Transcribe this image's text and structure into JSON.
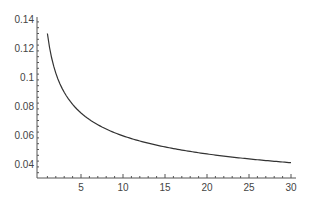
{
  "chart_data": {
    "type": "line",
    "title": "",
    "xlabel": "",
    "ylabel": "",
    "xlim": [
      0,
      31
    ],
    "ylim": [
      0.033,
      0.14
    ],
    "x_ticks": [
      5,
      10,
      15,
      20,
      25,
      30
    ],
    "y_ticks": [
      0.04,
      0.06,
      0.08,
      0.1,
      0.12,
      0.14
    ],
    "x_tick_labels": [
      "5",
      "10",
      "15",
      "20",
      "25",
      "30"
    ],
    "y_tick_labels": [
      "0.04",
      "0.06",
      "0.08",
      "0.1",
      "0.12",
      "0.14"
    ],
    "grid": false,
    "legend": null,
    "series": [
      {
        "name": "curve",
        "color": "#333333",
        "x": [
          1,
          2,
          3,
          4,
          5,
          6,
          8,
          10,
          12,
          15,
          18,
          20,
          22,
          25,
          28,
          30
        ],
        "y": [
          0.13,
          0.1028,
          0.0896,
          0.0812,
          0.0752,
          0.0707,
          0.0641,
          0.0594,
          0.0559,
          0.0518,
          0.0487,
          0.047,
          0.0455,
          0.0436,
          0.042,
          0.0411
        ]
      }
    ]
  }
}
